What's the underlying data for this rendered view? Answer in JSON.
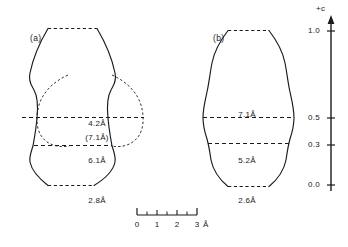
{
  "figure": {
    "type": "scientific-diagram"
  },
  "panels": [
    {
      "tag": "(a)",
      "tag_x": 30,
      "tag_y": 33,
      "dimensions": [
        {
          "label": "4.2Å",
          "x": 97,
          "y": 119
        },
        {
          "label": "(7.1Å)",
          "x": 97,
          "y": 133
        },
        {
          "label": "6.1Å",
          "x": 97,
          "y": 156
        },
        {
          "label": "2.8Å",
          "x": 97,
          "y": 196
        }
      ]
    },
    {
      "tag": "(b)",
      "tag_x": 213,
      "tag_y": 33,
      "dimensions": [
        {
          "label": "7.1Å",
          "x": 247,
          "y": 110
        },
        {
          "label": "5.2Å",
          "x": 247,
          "y": 156
        },
        {
          "label": "2.6Å",
          "x": 247,
          "y": 196
        }
      ]
    }
  ],
  "axis": {
    "name": "+c",
    "title": "+c",
    "title_x": 325,
    "title_y": 5,
    "x": 331,
    "top_y": 22,
    "bottom_y": 191,
    "ticks": [
      {
        "label": "1.0",
        "y": 31
      },
      {
        "label": "0.5",
        "y": 118
      },
      {
        "label": "0.3",
        "y": 145
      },
      {
        "label": "0.0",
        "y": 185
      }
    ]
  },
  "scale_bar": {
    "x0": 137,
    "y": 215,
    "major_ticks": [
      "0",
      "1",
      "2",
      "3"
    ],
    "unit": "Å",
    "labels_y": 222,
    "spacing": 20
  },
  "colors": {
    "ink": "#1a1a1a",
    "background": "#ffffff"
  }
}
